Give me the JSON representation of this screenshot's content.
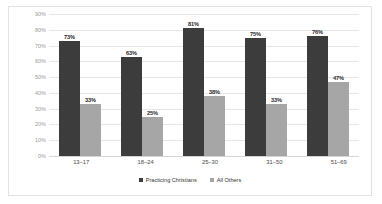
{
  "chart_data": {
    "type": "bar",
    "title": "",
    "subtitle": "",
    "xlabel": "",
    "ylabel": "",
    "categories": [
      "13–17",
      "18–24",
      "25–30",
      "31–50",
      "51–69"
    ],
    "series": [
      {
        "name": "Practicing Christians",
        "color": "#3c3c3c",
        "values": [
          73,
          63,
          81,
          75,
          76
        ],
        "labels": [
          "73%",
          "63%",
          "81%",
          "75%",
          "76%"
        ]
      },
      {
        "name": "All Others",
        "color": "#a6a6a6",
        "values": [
          33,
          25,
          38,
          33,
          47
        ],
        "labels": [
          "33%",
          "25%",
          "38%",
          "33%",
          "47%"
        ]
      }
    ],
    "ylim": [
      0,
      90
    ],
    "ytick_values": [
      0,
      10,
      20,
      30,
      40,
      50,
      60,
      70,
      80,
      90
    ],
    "ytick_labels": [
      "0%",
      "10%",
      "20%",
      "30%",
      "40%",
      "50%",
      "60%",
      "70%",
      "80%",
      "90%"
    ],
    "grid": "horizontal",
    "legend_position": "bottom-center",
    "value_labels_shown": true
  }
}
